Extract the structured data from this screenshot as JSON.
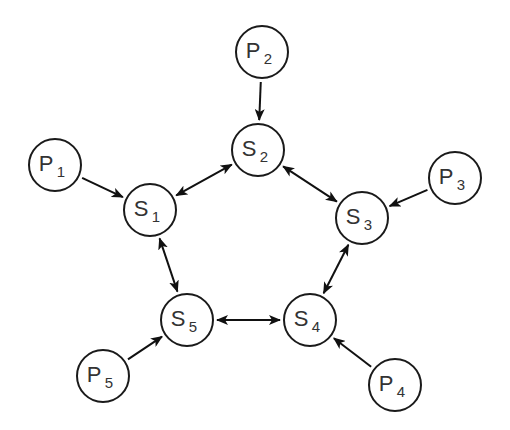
{
  "diagram": {
    "type": "ring-topology",
    "colors": {
      "stroke": "#1a1a1a",
      "text": "#333333",
      "background": "#ffffff"
    },
    "nodes": [
      {
        "id": "P1",
        "letter": "P",
        "sub": "1",
        "x": 55,
        "y": 165,
        "r": 26
      },
      {
        "id": "P2",
        "letter": "P",
        "sub": "2",
        "x": 262,
        "y": 52,
        "r": 26
      },
      {
        "id": "P3",
        "letter": "P",
        "sub": "3",
        "x": 455,
        "y": 178,
        "r": 26
      },
      {
        "id": "P4",
        "letter": "P",
        "sub": "4",
        "x": 395,
        "y": 385,
        "r": 26
      },
      {
        "id": "P5",
        "letter": "P",
        "sub": "5",
        "x": 103,
        "y": 376,
        "r": 26
      },
      {
        "id": "S1",
        "letter": "S",
        "sub": "1",
        "x": 150,
        "y": 210,
        "r": 26
      },
      {
        "id": "S2",
        "letter": "S",
        "sub": "2",
        "x": 258,
        "y": 150,
        "r": 26
      },
      {
        "id": "S3",
        "letter": "S",
        "sub": "3",
        "x": 362,
        "y": 218,
        "r": 26
      },
      {
        "id": "S4",
        "letter": "S",
        "sub": "4",
        "x": 310,
        "y": 320,
        "r": 26
      },
      {
        "id": "S5",
        "letter": "S",
        "sub": "5",
        "x": 187,
        "y": 320,
        "r": 26
      }
    ],
    "edges": [
      {
        "from": "P1",
        "to": "S1",
        "direction": "one-way"
      },
      {
        "from": "P2",
        "to": "S2",
        "direction": "one-way"
      },
      {
        "from": "P3",
        "to": "S3",
        "direction": "one-way"
      },
      {
        "from": "P4",
        "to": "S4",
        "direction": "one-way"
      },
      {
        "from": "P5",
        "to": "S5",
        "direction": "one-way"
      },
      {
        "from": "S1",
        "to": "S2",
        "direction": "two-way"
      },
      {
        "from": "S2",
        "to": "S3",
        "direction": "two-way"
      },
      {
        "from": "S3",
        "to": "S4",
        "direction": "two-way"
      },
      {
        "from": "S4",
        "to": "S5",
        "direction": "two-way"
      },
      {
        "from": "S5",
        "to": "S1",
        "direction": "two-way"
      }
    ]
  }
}
